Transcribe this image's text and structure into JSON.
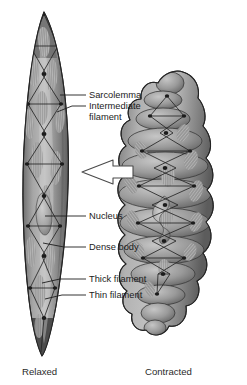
{
  "figure": {
    "background_color": "#ffffff",
    "ink_color": "#1b1b1b"
  },
  "labels": [
    {
      "id": "sarcolemma",
      "text": "Sarcolemma",
      "text2": ""
    },
    {
      "id": "intermediate-filament",
      "text": "Intermediate",
      "text2": "filament"
    },
    {
      "id": "nucleus",
      "text": "Nucleus",
      "text2": ""
    },
    {
      "id": "dense-body",
      "text": "Dense body",
      "text2": ""
    },
    {
      "id": "thick-filament",
      "text": "Thick filament",
      "text2": ""
    },
    {
      "id": "thin-filament",
      "text": "Thin filament",
      "text2": ""
    }
  ],
  "captions": {
    "left": "Relaxed",
    "right": "Contracted"
  },
  "arrow": {
    "name": "transition-arrow",
    "direction": "right",
    "fill": "#ffffff",
    "stroke": "#4a4a4a"
  },
  "cells": {
    "relaxed": {
      "name": "relaxed-smooth-muscle-cell",
      "shape": "elongated spindle",
      "body_fill": "#8d8d8d",
      "highlight": "#c8c8c8",
      "shadow": "#5a5a5a",
      "outline": "#2e2e2e"
    },
    "contracted": {
      "name": "contracted-smooth-muscle-cell",
      "shape": "shortened lobed globular",
      "body_fill": "#8d8d8d",
      "highlight": "#c8c8c8",
      "shadow": "#5a5a5a",
      "outline": "#2e2e2e"
    }
  }
}
